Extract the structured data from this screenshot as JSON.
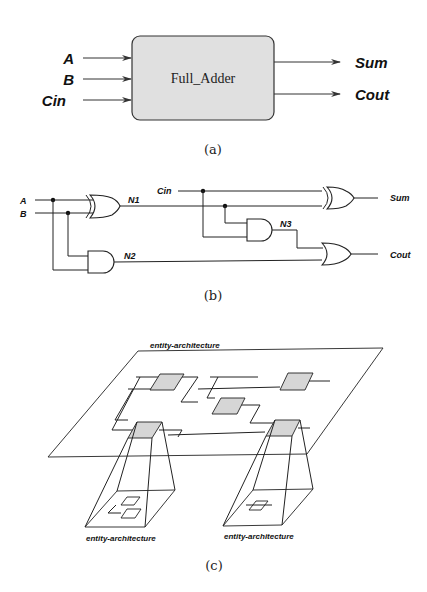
{
  "figure_a": {
    "block_label": "Full_Adder",
    "inputs": [
      "A",
      "B",
      "Cin"
    ],
    "outputs": [
      "Sum",
      "Cout"
    ],
    "caption": "(a)",
    "block_fill": "#e0e0e0"
  },
  "figure_b": {
    "inputs": [
      "A",
      "B"
    ],
    "carry_in": "Cin",
    "nets": [
      "N1",
      "N2",
      "N3"
    ],
    "outputs": [
      "Sum",
      "Cout"
    ],
    "gates": [
      "XOR",
      "AND",
      "AND",
      "XOR",
      "OR"
    ],
    "caption": "(b)"
  },
  "figure_c": {
    "top_label": "entity-architecture",
    "sub_labels": [
      "entity-architecture",
      "entity-architecture"
    ],
    "caption": "(c)",
    "module_fill": "#d6d6d6"
  }
}
